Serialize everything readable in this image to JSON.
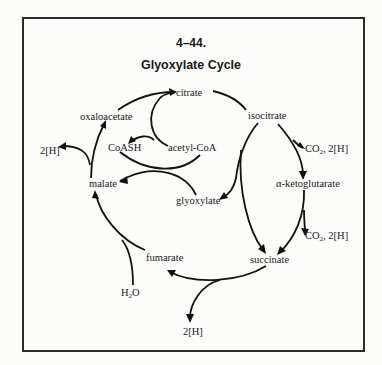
{
  "figure": {
    "number": "4–44.",
    "title": "Glyoxylate Cycle"
  },
  "metabolites": {
    "citrate": "citrate",
    "isocitrate": "isocitrate",
    "alpha_ketoglutarate": "α-ketoglutarate",
    "succinate": "succinate",
    "fumarate": "fumarate",
    "malate": "malate",
    "oxaloacetate": "oxaloacetate",
    "acetyl_coa": "acetyl-CoA",
    "coash": "CoASH",
    "glyoxylate": "glyoxylate"
  },
  "side_products": {
    "co2_1_prefix": "CO",
    "co2_1_sub": "2",
    "co2_1_suffix": ", 2[H]",
    "co2_2_prefix": "CO",
    "co2_2_sub": "2",
    "co2_2_suffix": ", 2[H]",
    "h_malate": "2[H]",
    "h_succinate": "2[H]",
    "water_prefix": "H",
    "water_sub": "2",
    "water_suffix": "O"
  },
  "colors": {
    "background": "#fcfcfa",
    "ink": "#111111",
    "border": "#2a2a2a"
  }
}
